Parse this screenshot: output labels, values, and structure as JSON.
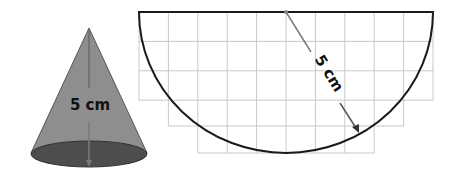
{
  "cone": {
    "label": "5 cm",
    "measure": "slant height",
    "fill_color": "#8c8c8c",
    "base_color": "#4a4a4a"
  },
  "net": {
    "shape": "semicircle",
    "label": "5 cm",
    "measure": "radius",
    "grid": {
      "cell_px": 29.4,
      "rows": [
        {
          "row": 1,
          "cells": 10
        },
        {
          "row": 2,
          "cells": 10
        },
        {
          "row": 3,
          "cells": 10
        },
        {
          "row": 4,
          "cells": 8
        },
        {
          "row": 5,
          "cells": 6
        }
      ]
    }
  }
}
